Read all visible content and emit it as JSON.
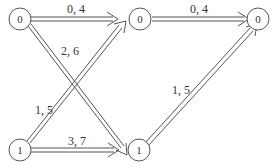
{
  "diagram": {
    "type": "bipartite-network",
    "colors": {
      "stroke": "#555555",
      "text": "#333333",
      "background": "#ffffff"
    },
    "nodes": [
      {
        "id": "n1",
        "label": "0",
        "position": "top-left"
      },
      {
        "id": "n2",
        "label": "0",
        "position": "top-middle"
      },
      {
        "id": "n3",
        "label": "0",
        "position": "top-right"
      },
      {
        "id": "n4",
        "label": "1",
        "position": "bottom-left"
      },
      {
        "id": "n5",
        "label": "1",
        "position": "bottom-middle"
      }
    ],
    "edges": [
      {
        "from": "n1",
        "to": "n2",
        "label": "0, 4"
      },
      {
        "from": "n1",
        "to": "n5",
        "label": "2, 6"
      },
      {
        "from": "n4",
        "to": "n2",
        "label": "1, 5"
      },
      {
        "from": "n4",
        "to": "n5",
        "label": "3, 7"
      },
      {
        "from": "n2",
        "to": "n3",
        "label": "0, 4"
      },
      {
        "from": "n5",
        "to": "n3",
        "label": "1, 5"
      }
    ]
  }
}
